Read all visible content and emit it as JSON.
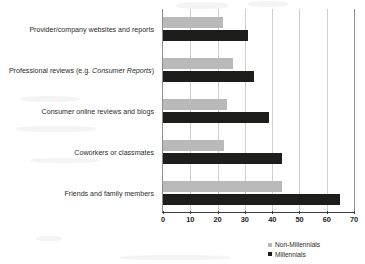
{
  "chart_data": {
    "type": "bar",
    "orientation": "horizontal",
    "title": "",
    "xlabel": "",
    "ylabel": "",
    "xlim": [
      0,
      70
    ],
    "xticks": [
      0,
      10,
      20,
      30,
      40,
      50,
      60,
      70
    ],
    "tick_labels": [
      "0",
      "10",
      "20",
      "30",
      "40",
      "50",
      "60",
      "70"
    ],
    "grid": true,
    "grid_axis": "x",
    "legend_position": "bottom-right",
    "categories": [
      "Provider/company websites and reports",
      "Professional reviews (e.g. Consumer Reports)",
      "Consumer online reviews and blogs",
      "Coworkers or classmates",
      "Friends and family members"
    ],
    "category_parts": [
      {
        "plain": "Provider/company websites and reports",
        "italic": "",
        "tail": ""
      },
      {
        "plain": "Professional reviews (e.g. ",
        "italic": "Consumer Reports",
        "tail": ")"
      },
      {
        "plain": "Consumer online reviews and blogs",
        "italic": "",
        "tail": ""
      },
      {
        "plain": "Coworkers or classmates",
        "italic": "",
        "tail": ""
      },
      {
        "plain": "Friends and family members",
        "italic": "",
        "tail": ""
      }
    ],
    "series": [
      {
        "name": "Non-Millennials",
        "color": "#b9b9b9",
        "values": [
          22,
          25.5,
          23.5,
          22.5,
          43.5
        ]
      },
      {
        "name": "Millennials",
        "color": "#1d1d1b",
        "values": [
          31,
          33.5,
          39,
          43.5,
          65
        ]
      }
    ]
  },
  "legend": {
    "items": [
      {
        "label": "Non-Millennials",
        "swatch": "legend-swatch-non-millennials"
      },
      {
        "label": "Millennials",
        "swatch": "legend-swatch-millennials"
      }
    ]
  }
}
